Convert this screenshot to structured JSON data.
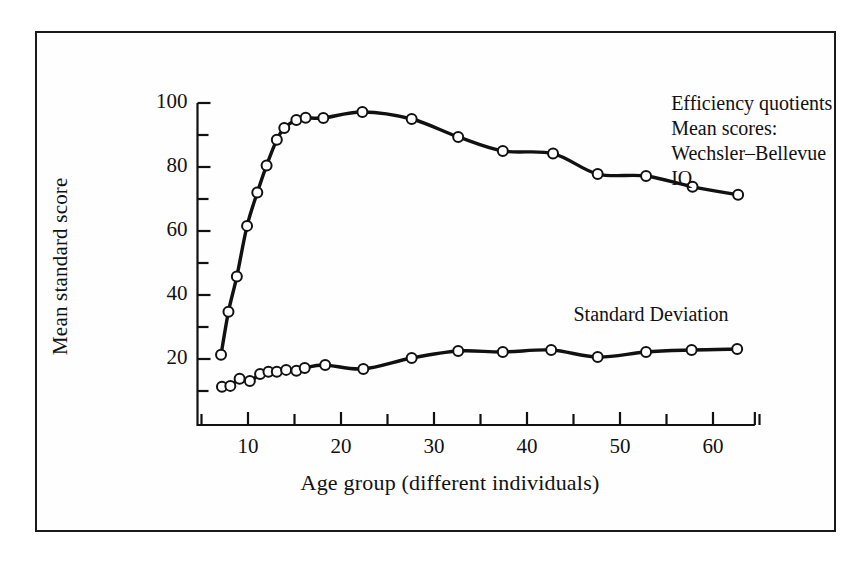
{
  "figure": {
    "background_color": "#ffffff",
    "frame_color": "#1a1a1a",
    "ink_color": "#111111"
  },
  "chart_data": {
    "type": "line",
    "title": "",
    "xlabel": "Age group (different individuals)",
    "ylabel": "Mean standard score",
    "xlim": [
      5,
      65
    ],
    "ylim": [
      0,
      104
    ],
    "grid": false,
    "legend_position": "inside-annotations",
    "xticks_major": [
      10,
      20,
      30,
      40,
      50,
      60
    ],
    "xticks_minor": [
      5,
      15,
      25,
      35,
      45,
      55,
      65
    ],
    "xtick_labels": [
      "10",
      "20",
      "30",
      "40",
      "50",
      "60"
    ],
    "yticks_major": [
      20,
      40,
      60,
      80,
      100
    ],
    "yticks_minor": [
      10,
      30,
      50,
      70,
      90
    ],
    "ytick_labels": [
      "20",
      "40",
      "60",
      "80",
      "100"
    ],
    "marker": "open-circle",
    "annotations": [
      {
        "name": "iq-series-annotation",
        "lines": [
          "Efficiency quotients",
          "Mean scores:",
          "Wechsler–Bellevue",
          "IQ"
        ],
        "x": 55.5,
        "y": 102
      },
      {
        "name": "sd-series-annotation",
        "lines": [
          "Standard Deviation"
        ],
        "x": 45.0,
        "y": 36
      }
    ],
    "series": [
      {
        "name": "Efficiency quotients Mean scores: Wechsler-Bellevue IQ",
        "short_name": "IQ",
        "color": "#111111",
        "points": [
          [
            7.1,
            21.3
          ],
          [
            7.9,
            34.8
          ],
          [
            8.8,
            45.8
          ],
          [
            9.9,
            61.6
          ],
          [
            11.0,
            72.0
          ],
          [
            12.0,
            80.5
          ],
          [
            13.1,
            88.5
          ],
          [
            13.9,
            92.2
          ],
          [
            15.2,
            94.7
          ],
          [
            16.2,
            95.4
          ],
          [
            18.1,
            95.3
          ],
          [
            22.3,
            97.2
          ],
          [
            27.6,
            95.0
          ],
          [
            32.6,
            89.4
          ],
          [
            37.4,
            85.0
          ],
          [
            42.8,
            84.2
          ],
          [
            47.6,
            77.8
          ],
          [
            52.8,
            77.2
          ],
          [
            57.8,
            73.8
          ],
          [
            62.7,
            71.3
          ]
        ]
      },
      {
        "name": "Standard Deviation",
        "short_name": "SD",
        "color": "#111111",
        "points": [
          [
            7.2,
            11.3
          ],
          [
            8.1,
            11.6
          ],
          [
            9.1,
            13.8
          ],
          [
            10.2,
            13.1
          ],
          [
            11.3,
            15.3
          ],
          [
            12.2,
            16.0
          ],
          [
            13.1,
            16.0
          ],
          [
            14.1,
            16.6
          ],
          [
            15.2,
            16.3
          ],
          [
            16.1,
            17.2
          ],
          [
            18.3,
            18.1
          ],
          [
            22.4,
            16.9
          ],
          [
            27.6,
            20.3
          ],
          [
            32.6,
            22.5
          ],
          [
            37.4,
            22.2
          ],
          [
            42.6,
            22.8
          ],
          [
            47.6,
            20.6
          ],
          [
            52.8,
            22.2
          ],
          [
            57.7,
            22.8
          ],
          [
            62.6,
            23.1
          ]
        ]
      }
    ]
  }
}
